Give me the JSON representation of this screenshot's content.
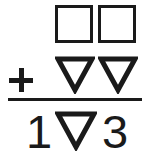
{
  "puzzle": {
    "type": "shape-addition-puzzle",
    "background_color": "#ffffff",
    "ink_color": "#1a1a1a",
    "operator": {
      "symbol": "+",
      "name": "plus-sign"
    },
    "rows": [
      {
        "name": "addend-row-1",
        "cells": [
          {
            "kind": "square",
            "label": "square",
            "value": ""
          },
          {
            "kind": "square",
            "label": "square",
            "value": ""
          }
        ]
      },
      {
        "name": "addend-row-2",
        "cells": [
          {
            "kind": "triangle-down",
            "label": "triangle",
            "value": ""
          },
          {
            "kind": "triangle-down",
            "label": "triangle",
            "value": ""
          }
        ]
      },
      {
        "name": "sum-row",
        "cells": [
          {
            "kind": "digit",
            "label": "digit",
            "value": "1"
          },
          {
            "kind": "triangle-down",
            "label": "triangle",
            "value": ""
          },
          {
            "kind": "digit",
            "label": "digit",
            "value": "3"
          }
        ]
      }
    ],
    "sum_rule": {
      "name": "horizontal-rule"
    },
    "equation_text": "□ □ + ▽ ▽ = 1 ▽ 3"
  }
}
